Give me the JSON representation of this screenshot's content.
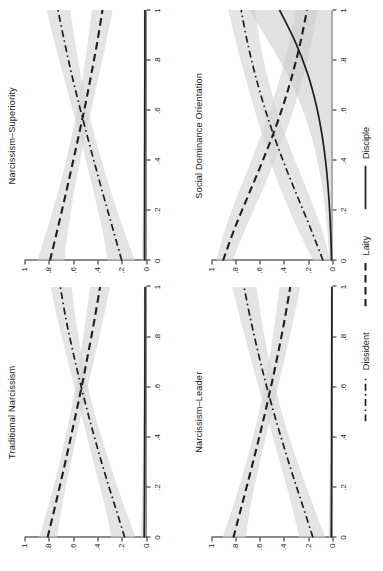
{
  "figure": {
    "orientation": "rotated-90-ccw",
    "background": "#ffffff",
    "ink_color": "#1f1f1f",
    "band_color": "#d4d4d4"
  },
  "legend": {
    "position": "bottom",
    "items": [
      {
        "label": "Dissident",
        "style": "dash-dot"
      },
      {
        "label": "Laity",
        "style": "dashed"
      },
      {
        "label": "Disciple",
        "style": "solid"
      }
    ]
  },
  "axes": {
    "x_ticks": [
      "0",
      ".2",
      ".4",
      ".6",
      ".8",
      "1"
    ],
    "y_ticks": [
      "0",
      ".2",
      ".4",
      ".6",
      ".8",
      "1"
    ],
    "xlim": [
      0,
      1
    ],
    "ylim": [
      0,
      1
    ],
    "xlabel": "",
    "ylabel": ""
  },
  "chart_data": {
    "type": "line",
    "title": "",
    "xlabel": "",
    "ylabel": "",
    "xlim": [
      0,
      1
    ],
    "ylim": [
      0,
      1
    ],
    "grid": false,
    "legend_position": "bottom",
    "x_ticks": [
      0,
      0.2,
      0.4,
      0.6,
      0.8,
      1
    ],
    "y_ticks": [
      0,
      0.2,
      0.4,
      0.6,
      0.8,
      1
    ],
    "panel_layout": "2x2",
    "panels": [
      {
        "title": "Traditional Narcissism",
        "position": "top-left",
        "x": [
          0,
          0.125,
          0.25,
          0.375,
          0.5,
          0.625,
          0.75,
          0.875,
          1
        ],
        "series": [
          {
            "name": "Dissident",
            "style": "dash-dot",
            "values": [
              0.175,
              0.255,
              0.335,
              0.41,
              0.48,
              0.545,
              0.605,
              0.66,
              0.705
            ],
            "lower": [
              0.085,
              0.18,
              0.268,
              0.35,
              0.425,
              0.487,
              0.538,
              0.58,
              0.612
            ],
            "upper": [
              0.285,
              0.338,
              0.405,
              0.472,
              0.537,
              0.603,
              0.668,
              0.73,
              0.785
            ]
          },
          {
            "name": "Laity",
            "style": "dashed",
            "values": [
              0.81,
              0.748,
              0.688,
              0.63,
              0.574,
              0.52,
              0.47,
              0.422,
              0.378
            ],
            "lower": [
              0.735,
              0.69,
              0.64,
              0.585,
              0.528,
              0.468,
              0.408,
              0.35,
              0.295
            ],
            "upper": [
              0.88,
              0.805,
              0.735,
              0.675,
              0.62,
              0.572,
              0.532,
              0.495,
              0.462
            ]
          },
          {
            "name": "Disciple",
            "style": "solid",
            "values": [
              0.015,
              0.013,
              0.012,
              0.011,
              0.01,
              0.009,
              0.009,
              0.008,
              0.008
            ],
            "lower": [
              0.0,
              0.0,
              0.0,
              0.0,
              0.0,
              0.0,
              0.0,
              0.0,
              0.0
            ],
            "upper": [
              0.04,
              0.034,
              0.029,
              0.026,
              0.023,
              0.021,
              0.019,
              0.018,
              0.017
            ]
          }
        ]
      },
      {
        "title": "Narcissism–Superiority",
        "position": "top-right",
        "x": [
          0,
          0.125,
          0.25,
          0.375,
          0.5,
          0.625,
          0.75,
          0.875,
          1
        ],
        "series": [
          {
            "name": "Dissident",
            "style": "dash-dot",
            "values": [
              0.2,
              0.272,
              0.345,
              0.416,
              0.485,
              0.552,
              0.615,
              0.672,
              0.725
            ],
            "lower": [
              0.09,
              0.185,
              0.272,
              0.352,
              0.424,
              0.487,
              0.54,
              0.585,
              0.622
            ],
            "upper": [
              0.315,
              0.36,
              0.42,
              0.482,
              0.548,
              0.617,
              0.688,
              0.755,
              0.818
            ]
          },
          {
            "name": "Laity",
            "style": "dashed",
            "values": [
              0.79,
              0.728,
              0.668,
              0.61,
              0.553,
              0.498,
              0.448,
              0.4,
              0.358
            ],
            "lower": [
              0.672,
              0.64,
              0.6,
              0.552,
              0.498,
              0.44,
              0.382,
              0.326,
              0.275
            ],
            "upper": [
              0.895,
              0.815,
              0.738,
              0.67,
              0.61,
              0.558,
              0.515,
              0.478,
              0.446
            ]
          },
          {
            "name": "Disciple",
            "style": "solid",
            "values": [
              0.012,
              0.012,
              0.011,
              0.011,
              0.01,
              0.01,
              0.009,
              0.009,
              0.009
            ],
            "lower": [
              0.0,
              0.0,
              0.0,
              0.0,
              0.0,
              0.0,
              0.0,
              0.0,
              0.0
            ],
            "upper": [
              0.032,
              0.029,
              0.026,
              0.024,
              0.022,
              0.021,
              0.02,
              0.019,
              0.018
            ]
          }
        ]
      },
      {
        "title": "Narcissism–Leader",
        "position": "bottom-left",
        "x": [
          0,
          0.125,
          0.25,
          0.375,
          0.5,
          0.625,
          0.75,
          0.875,
          1
        ],
        "series": [
          {
            "name": "Dissident",
            "style": "dash-dot",
            "values": [
              0.165,
              0.248,
              0.332,
              0.412,
              0.488,
              0.558,
              0.622,
              0.68,
              0.732
            ],
            "lower": [
              0.062,
              0.16,
              0.255,
              0.343,
              0.422,
              0.488,
              0.543,
              0.59,
              0.628
            ],
            "upper": [
              0.278,
              0.338,
              0.408,
              0.48,
              0.552,
              0.625,
              0.697,
              0.765,
              0.828
            ]
          },
          {
            "name": "Laity",
            "style": "dashed",
            "values": [
              0.82,
              0.752,
              0.685,
              0.62,
              0.558,
              0.5,
              0.446,
              0.396,
              0.352
            ],
            "lower": [
              0.718,
              0.678,
              0.625,
              0.566,
              0.504,
              0.441,
              0.38,
              0.322,
              0.27
            ],
            "upper": [
              0.908,
              0.822,
              0.742,
              0.672,
              0.61,
              0.557,
              0.512,
              0.474,
              0.442
            ]
          },
          {
            "name": "Disciple",
            "style": "solid",
            "values": [
              0.014,
              0.013,
              0.012,
              0.011,
              0.011,
              0.01,
              0.01,
              0.009,
              0.009
            ],
            "lower": [
              0.0,
              0.0,
              0.0,
              0.0,
              0.0,
              0.0,
              0.0,
              0.0,
              0.0
            ],
            "upper": [
              0.036,
              0.032,
              0.029,
              0.026,
              0.024,
              0.022,
              0.021,
              0.02,
              0.019
            ]
          }
        ]
      },
      {
        "title": "Social Dominance Orientation",
        "position": "bottom-right",
        "x": [
          0,
          0.125,
          0.25,
          0.375,
          0.5,
          0.625,
          0.75,
          0.875,
          1
        ],
        "series": [
          {
            "name": "Dissident",
            "style": "dash-dot",
            "values": [
              0.082,
              0.182,
              0.288,
              0.392,
              0.488,
              0.572,
              0.645,
              0.706,
              0.756
            ],
            "lower": [
              0.022,
              0.092,
              0.188,
              0.292,
              0.392,
              0.478,
              0.548,
              0.602,
              0.642
            ],
            "upper": [
              0.165,
              0.29,
              0.402,
              0.5,
              0.582,
              0.66,
              0.732,
              0.8,
              0.862
            ]
          },
          {
            "name": "Laity",
            "style": "dashed",
            "values": [
              0.905,
              0.812,
              0.706,
              0.598,
              0.496,
              0.406,
              0.33,
              0.266,
              0.214
            ],
            "lower": [
              0.828,
              0.722,
              0.608,
              0.498,
              0.398,
              0.31,
              0.236,
              0.176,
              0.128
            ],
            "upper": [
              0.96,
              0.888,
              0.794,
              0.692,
              0.592,
              0.502,
              0.424,
              0.358,
              0.304
            ]
          },
          {
            "name": "Disciple",
            "style": "solid",
            "values": [
              0.012,
              0.02,
              0.034,
              0.056,
              0.09,
              0.14,
              0.212,
              0.312,
              0.44
            ],
            "lower": [
              0.0,
              0.0,
              0.0,
              0.0,
              0.0,
              0.0,
              0.0,
              0.0,
              0.0
            ],
            "upper": [
              0.03,
              0.048,
              0.076,
              0.118,
              0.18,
              0.268,
              0.386,
              0.532,
              0.69
            ]
          }
        ]
      }
    ]
  }
}
